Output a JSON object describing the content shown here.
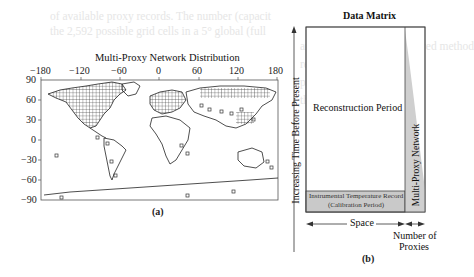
{
  "background_text": [
    "of available proxy records. The number (capacit",
    "the 2,592 possible grid cells in a 5° global (full",
    "and depends on the employed method",
    "reconstruction methods",
    "proxy-observation",
    "the number"
  ],
  "panel_a": {
    "title": "Multi-Proxy Network Distribution",
    "label": "(a)",
    "x_ticks": [
      "−180",
      "−120",
      "−60",
      "0",
      "60",
      "120",
      "180"
    ],
    "y_ticks": [
      "90",
      "60",
      "30",
      "0",
      "−30",
      "−60",
      "−90"
    ]
  },
  "panel_b": {
    "title": "Data Matrix",
    "label": "(b)",
    "y_axis_label": "Increasing Time Before Present",
    "reconstruction_label": "Reconstruction Period",
    "calibration_line1": "Instrumental Temperature Record",
    "calibration_line2": "(Calibration Period)",
    "network_label": "Multi-Proxy Network",
    "space_label": "Space",
    "proxies_line1": "Number of",
    "proxies_line2": "Proxies"
  },
  "colors": {
    "calibration_fill": "#c9c9c9",
    "network_fill": "#cfcfcf",
    "frame": "#444444"
  }
}
